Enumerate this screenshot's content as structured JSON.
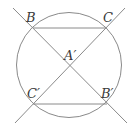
{
  "diagram": {
    "type": "geometry",
    "stroke_color": "#8a8a8a",
    "label_color": "#3a3a3a",
    "circle": {
      "cx": 69,
      "cy": 65,
      "r": 52.5
    },
    "points": {
      "B": {
        "label": "B",
        "x": 33,
        "y": 28
      },
      "C": {
        "label": "C",
        "x": 107,
        "y": 28
      },
      "A1": {
        "label": "A′",
        "x": 70,
        "y": 66
      },
      "C1": {
        "label": "C′",
        "x": 33,
        "y": 104
      },
      "B1": {
        "label": "B′",
        "x": 107,
        "y": 104
      }
    },
    "lines": [
      {
        "name": "line-BB1",
        "x1": 13,
        "y1": 8,
        "x2": 127,
        "y2": 123
      },
      {
        "name": "line-CC1",
        "x1": 125,
        "y1": 8,
        "x2": 15,
        "y2": 123
      }
    ],
    "segments": [
      {
        "name": "segment-BC",
        "from": "B",
        "to": "C"
      },
      {
        "name": "segment-C1B1",
        "from": "C1",
        "to": "B1"
      }
    ],
    "labels": {
      "B": "B",
      "C": "C",
      "A1": "A′",
      "C1": "C′",
      "B1": "B′"
    }
  }
}
